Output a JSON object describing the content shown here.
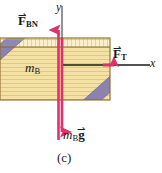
{
  "figure": {
    "caption": "(c)",
    "axes": {
      "y_label": "y",
      "x_label": "x",
      "axis_color": "#1a1a1a",
      "origin": {
        "x": 62,
        "y": 65
      }
    },
    "block": {
      "mass_label_symbol": "m",
      "mass_label_subscript": "B",
      "fill_color": "#f2dfa0",
      "top_face_color": "#f7ecc4",
      "edge_color": "#8a6b2a",
      "stripe_color": "#e3c97f",
      "band_color": "#8b83ae",
      "band_edge_color": "#6e6590",
      "x": 0,
      "y": 38,
      "width": 110,
      "height": 62
    },
    "vectors": [
      {
        "name": "normal-force",
        "symbol": "F",
        "subscript": "BN",
        "label": "F_BN",
        "direction": "up",
        "color": "#e0316d",
        "tail": {
          "x": 62,
          "y": 140
        },
        "head": {
          "x": 62,
          "y": 20
        }
      },
      {
        "name": "tension-force",
        "symbol": "F",
        "subscript": "T",
        "label": "F_T",
        "direction": "right",
        "color": "#e0316d",
        "tail": {
          "x": 104,
          "y": 65
        },
        "head": {
          "x": 122,
          "y": 65
        }
      },
      {
        "name": "weight-force",
        "symbol": "m",
        "subscript": "B",
        "vector_symbol": "g",
        "label": "m_B g",
        "direction": "down",
        "color": "#e0316d",
        "tail": {
          "x": 62,
          "y": 38
        },
        "head": {
          "x": 62,
          "y": 141
        }
      }
    ],
    "vector_arrow_glyph": "⇀"
  }
}
